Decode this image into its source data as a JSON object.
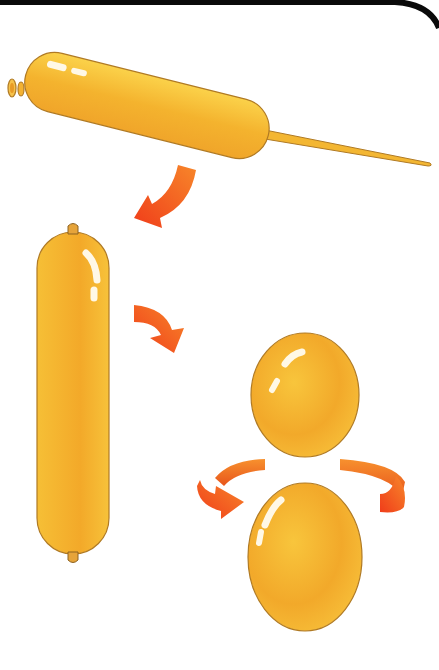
{
  "illustration": {
    "subject": "balloon twisting steps",
    "steps": [
      {
        "id": 1,
        "description": "inflated long balloon with uninflated tail"
      },
      {
        "id": 2,
        "description": "long balloon shown vertically, knotted both ends"
      },
      {
        "id": 3,
        "description": "balloon twisted into two bubbles with rotation arrow"
      }
    ]
  },
  "colors": {
    "balloon_light": "#fbd24a",
    "balloon_mid": "#f4b32e",
    "balloon_dark": "#eb9a22",
    "balloon_outline": "#b07a24",
    "highlight": "#fff8e6",
    "arrow_light": "#f7862a",
    "arrow_dark": "#f03d1a",
    "border": "#0a0a0a",
    "background": "#ffffff"
  }
}
